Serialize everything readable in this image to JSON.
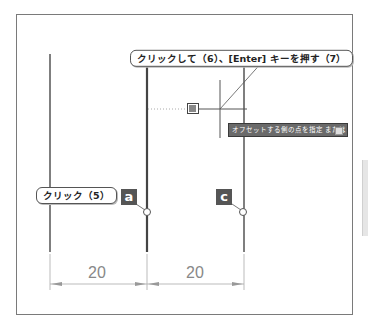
{
  "callouts": {
    "top": "クリックして（6）、[Enter] キーを押す（7）",
    "left": "クリック（5）"
  },
  "labels": {
    "a": "a",
    "c": "c"
  },
  "tooltip": {
    "text": "オフセットする側の点を指定 または",
    "icon": "dropdown-icon"
  },
  "dimensions": [
    {
      "value": "20"
    },
    {
      "value": "20"
    }
  ],
  "colors": {
    "line": "#555555",
    "dimension": "#999999",
    "label_bg": "#555555",
    "tooltip_bg": "#6a6a6a"
  }
}
